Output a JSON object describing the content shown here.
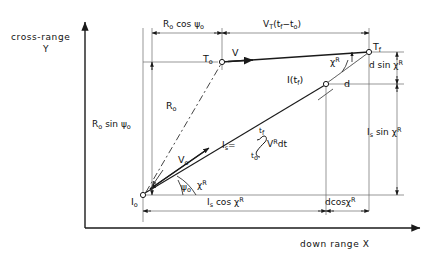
{
  "figure": {
    "type": "vector-geometry-diagram",
    "title_visible": false,
    "axes": {
      "y_axis_label_line1": "cross-range",
      "y_axis_label_line2": "Y",
      "x_axis_label": "down range X"
    },
    "points": [
      {
        "id": "I0",
        "label": "I",
        "sub": "o",
        "x": 143,
        "y": 195,
        "desc": "interceptor initial position at origin"
      },
      {
        "id": "T0",
        "label": "T",
        "sub": "o",
        "x": 222,
        "y": 62,
        "desc": "target initial position"
      },
      {
        "id": "Tf",
        "label": "T",
        "sub": "f",
        "x": 369,
        "y": 52,
        "desc": "target final position"
      },
      {
        "id": "Itf",
        "label": "I(t",
        "sub": "f",
        "tail": ")",
        "x": 326,
        "y": 84,
        "desc": "interceptor position at final time"
      }
    ],
    "dimensions": [
      {
        "id": "r0cos",
        "text_parts": [
          "R",
          "o",
          " cos ",
          "ψ",
          "o"
        ],
        "display": "Rₒ cos ψₒ",
        "orientation": "horizontal",
        "from_x": 152,
        "to_x": 222,
        "y": 33
      },
      {
        "id": "vttf",
        "display": "Vₜ(t_f − tₒ)",
        "orientation": "horizontal",
        "from_x": 222,
        "to_x": 369,
        "y": 33
      },
      {
        "id": "r0sin",
        "display": "Rₒ sin ψₒ",
        "orientation": "vertical",
        "x": 152,
        "from_y": 62,
        "to_y": 195
      },
      {
        "id": "dsin",
        "display": "d sin χᴿ",
        "orientation": "vertical",
        "x": 397,
        "from_y": 52,
        "to_y": 84
      },
      {
        "id": "issin",
        "display": "Iₛ sin χᴿ",
        "orientation": "vertical",
        "x": 397,
        "from_y": 84,
        "to_y": 195
      },
      {
        "id": "iscos",
        "display": "Iₛ cos χᴿ",
        "orientation": "horizontal",
        "from_x": 143,
        "to_x": 326,
        "y": 211
      },
      {
        "id": "dcos",
        "display": "dcosχᴿ",
        "orientation": "horizontal",
        "from_x": 326,
        "to_x": 369,
        "y": 211
      }
    ],
    "vectors": [
      {
        "id": "V",
        "display": "V",
        "desc": "target velocity arrow at T0, pointing right"
      },
      {
        "id": "R0",
        "display": "Rₒ",
        "desc": "initial range, dashed line I0 to T0"
      },
      {
        "id": "V0",
        "display": "Vₒ",
        "desc": "interceptor initial velocity arrow from I0"
      },
      {
        "id": "Is",
        "display": "Iₛ",
        "desc": "interceptor displacement line I0 to I(tf)"
      },
      {
        "id": "d",
        "display": "d",
        "desc": "miss distance dashed segment I(tf) to Tf"
      }
    ],
    "angles": [
      {
        "id": "psi0",
        "display": "ψₒ",
        "at": "I0",
        "desc": "angle between R0 line and X axis"
      },
      {
        "id": "chiR_origin",
        "display": "χᴿ",
        "at": "I0",
        "desc": "angle of interceptor path from X axis"
      },
      {
        "id": "chiR_top",
        "display": "χᴿ",
        "at": "Tf",
        "desc": "angle between d line and horizontal"
      }
    ],
    "labels": {
      "V": "V",
      "V0_main": "V",
      "V0_sub": "o",
      "R0_main": "R",
      "R0_sub": "o",
      "d": "d",
      "psi_origin": "ψ",
      "psi_origin_sub": "o",
      "chi_origin": "χ",
      "chi_origin_sup": "R",
      "chi_top": "χ",
      "chi_top_sup": "R",
      "T0_main": "T",
      "T0_sub": "o",
      "Tf_main": "T",
      "Tf_sub": "f",
      "I0_main": "I",
      "I0_sub": "o",
      "Itf_text": "I(t",
      "Itf_sub": "f",
      "Itf_tail": ")"
    },
    "formula": {
      "lhs_main": "I",
      "lhs_sub": "s",
      "equals": "=",
      "integral_symbol": "∫",
      "upper_limit_main": "t",
      "upper_limit_sub": "f",
      "lower_limit_main": "t",
      "lower_limit_sub": "o",
      "integrand_main": "V",
      "integrand_sup": "R",
      "integrand_d": "dt",
      "display": "Iₛ = ∫(tₒ to t_f) Vᴿ dt"
    },
    "dimension_texts": {
      "r0cos_main": "R",
      "r0cos_sub": "o",
      "r0cos_mid": "cos",
      "r0cos_psi": "ψ",
      "r0cos_psi_sub": "o",
      "vt_main": "V",
      "vt_sub": "T",
      "vt_expr_open": "(t",
      "vt_expr_f": "f",
      "vt_minus": "−t",
      "vt_o": "o",
      "vt_close": ")",
      "r0sin_main": "R",
      "r0sin_sub": "o",
      "r0sin_mid": "sin",
      "r0sin_psi": "ψ",
      "r0sin_psi_sub": "o",
      "dsin_text": "d sin",
      "dsin_chi": "χ",
      "dsin_chi_sup": "R",
      "issin_main": "I",
      "issin_sub": "s",
      "issin_mid": "sin",
      "issin_chi": "χ",
      "issin_chi_sup": "R",
      "iscos_main": "I",
      "iscos_sub": "s",
      "iscos_mid": "cos",
      "iscos_chi": "χ",
      "iscos_chi_sup": "R",
      "dcos_text": "dcos",
      "dcos_chi": "χ",
      "dcos_chi_sup": "R"
    },
    "colors": {
      "ink": "#1a1a1a",
      "thin_line": "#555555",
      "background": "#ffffff"
    }
  }
}
